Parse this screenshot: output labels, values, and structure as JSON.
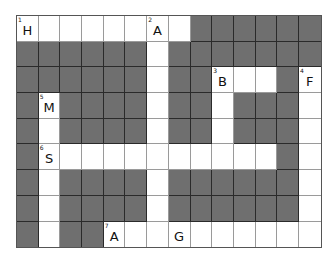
{
  "puzzle": {
    "rows": 9,
    "cols": 14,
    "colors": {
      "dark": "#6f6f6f",
      "light": "#ffffff"
    },
    "layout": [
      "WWWWWWWWDDDDDD",
      "DDDDDDWDDDDDDD",
      "DDDDDDWDDWWWDW",
      "DWDDDDWDDWDDDW",
      "DWDDDDWDDWDDDW",
      "DWWWWWWWWWWWDW",
      "DWDDDDWDDDDDDW",
      "DWDDDDWDDDDDDW",
      "DWDDWWWWWWWWWW"
    ],
    "cells": [
      {
        "r": 0,
        "c": 0,
        "num": "1",
        "letter": "H"
      },
      {
        "r": 0,
        "c": 6,
        "num": "2",
        "letter": "A"
      },
      {
        "r": 2,
        "c": 9,
        "num": "3",
        "letter": "B"
      },
      {
        "r": 2,
        "c": 13,
        "num": "4",
        "letter": "F"
      },
      {
        "r": 3,
        "c": 1,
        "num": "5",
        "letter": "M"
      },
      {
        "r": 5,
        "c": 1,
        "num": "6",
        "letter": "S"
      },
      {
        "r": 8,
        "c": 4,
        "num": "7",
        "letter": "A"
      },
      {
        "r": 8,
        "c": 7,
        "num": "",
        "letter": "G"
      }
    ]
  }
}
